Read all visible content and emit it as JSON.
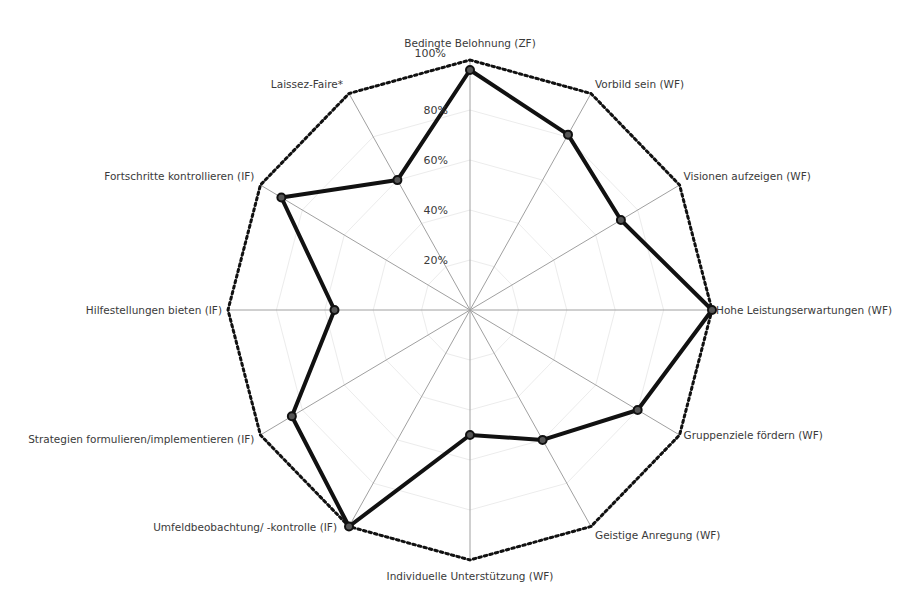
{
  "chart_data": {
    "type": "radar",
    "title": "",
    "categories": [
      "Bedingte Belohnung (ZF)",
      "Vorbild sein (WF)",
      "Visionen aufzeigen (WF)",
      "Hohe Leistungserwartungen (WF)",
      "Gruppenziele fördern (WF)",
      "Geistige Anregung (WF)",
      "Individuelle Unterstützung (WF)",
      "Umfeldbeobachtung/ -kontrolle (IF)",
      "Strategien formulieren/implementieren (IF)",
      "Hilfestellungen bieten (IF)",
      "Fortschritte kontrollieren (IF)",
      "Laissez-Faire*"
    ],
    "series": [
      {
        "name": "Ausprägung",
        "values": [
          96,
          81,
          72,
          100,
          80,
          60,
          50,
          100,
          85,
          56,
          90,
          60
        ]
      }
    ],
    "rlim": [
      0,
      100
    ],
    "ticks": [
      "20%",
      "40%",
      "60%",
      "80%",
      "100%"
    ],
    "tick_values": [
      20,
      40,
      60,
      80,
      100
    ],
    "grid": true,
    "outer_boundary": "dotted",
    "legend": "none"
  },
  "colors": {
    "series": "#111111",
    "spokes": "#a0a0a0",
    "rings": "#ececec",
    "text": "#3a3a3a"
  }
}
